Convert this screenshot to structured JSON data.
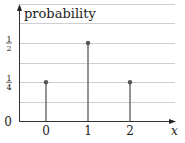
{
  "chart_data": {
    "type": "stem",
    "title": "",
    "xlabel": "x",
    "ylabel": "probability",
    "categories": [
      "0",
      "1",
      "2"
    ],
    "x": [
      0,
      1,
      2
    ],
    "values": [
      0.25,
      0.5,
      0.25
    ],
    "value_labels": [
      "1/4",
      "1/2",
      "1/4"
    ],
    "y_ticks": [
      {
        "value": 0,
        "label": "0"
      },
      {
        "value": 0.25,
        "label": "1/4"
      },
      {
        "value": 0.5,
        "label": "1/2"
      }
    ],
    "ylim": [
      0,
      0.75
    ],
    "grid": {
      "horizontal": true,
      "step": 0.125
    },
    "legend": null
  },
  "colors": {
    "stem": "#777777",
    "marker": "#555555",
    "grid": "#cfcfcf",
    "axis": "#333333",
    "text": "#222222"
  }
}
